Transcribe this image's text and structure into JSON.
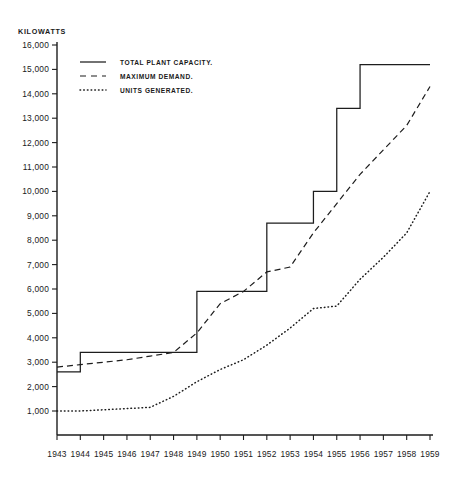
{
  "chart_data": {
    "type": "line",
    "title": "",
    "subtitle": "",
    "xlabel": "",
    "ylabel": "KILOWATTS",
    "grid": false,
    "legend_position": "top-left",
    "x": [
      1943,
      1944,
      1945,
      1946,
      1947,
      1948,
      1949,
      1950,
      1951,
      1952,
      1953,
      1954,
      1955,
      1956,
      1957,
      1958,
      1959
    ],
    "categories": [
      "1943",
      "1944",
      "1945",
      "1946",
      "1947",
      "1948",
      "1949",
      "1950",
      "1951",
      "1952",
      "1953",
      "1954",
      "1955",
      "1956",
      "1957",
      "1958",
      "1959"
    ],
    "xlim": [
      1943,
      1959
    ],
    "ylim": [
      0,
      16000
    ],
    "ytick_values": [
      1000,
      2000,
      3000,
      4000,
      5000,
      6000,
      7000,
      8000,
      9000,
      10000,
      11000,
      12000,
      13000,
      14000,
      15000,
      16000
    ],
    "ytick_labels": [
      "1,000",
      "2,000",
      "3,000",
      "4,000",
      "5,000",
      "6,000",
      "7,000",
      "8,000",
      "9,000",
      "10,000",
      "11,000",
      "12,000",
      "13,000",
      "14,000",
      "15,000",
      "16,000"
    ],
    "series": [
      {
        "name": "TOTAL PLANT CAPACITY.",
        "style": "solid",
        "step": true,
        "values": [
          2600,
          3400,
          3400,
          3400,
          3400,
          3400,
          5900,
          5900,
          5900,
          8700,
          8700,
          10000,
          13400,
          15200,
          15200,
          15200,
          15200
        ]
      },
      {
        "name": "MAXIMUM DEMAND.",
        "style": "dashed",
        "step": false,
        "values": [
          2800,
          2900,
          3000,
          3100,
          3250,
          3400,
          4200,
          5400,
          5900,
          6700,
          6900,
          8300,
          9500,
          10700,
          11700,
          12700,
          14300
        ]
      },
      {
        "name": "UNITS GENERATED.",
        "style": "dotted",
        "step": false,
        "values": [
          1000,
          1000,
          1050,
          1100,
          1150,
          1600,
          2200,
          2700,
          3100,
          3700,
          4400,
          5200,
          5300,
          6400,
          7300,
          8300,
          10000
        ]
      }
    ]
  },
  "legend": {
    "items": [
      {
        "label": "TOTAL PLANT CAPACITY.",
        "style": "solid"
      },
      {
        "label": "MAXIMUM DEMAND.",
        "style": "dashed"
      },
      {
        "label": "UNITS GENERATED.",
        "style": "dotted"
      }
    ]
  }
}
